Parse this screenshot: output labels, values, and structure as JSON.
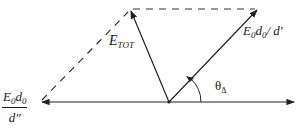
{
  "diagram": {
    "vectors": [
      {
        "id": "e-tot",
        "label_main": "E",
        "label_sub": "TOT",
        "style": "solid"
      },
      {
        "id": "e0d0-over-dprime",
        "label_main": "E",
        "label_sub1": "0",
        "label_mid": "d",
        "label_sub2": "0",
        "label_tail": "/ d′",
        "style": "solid"
      },
      {
        "id": "e0d0-over-ddprime",
        "numerator_main": "E",
        "numerator_sub1": "0",
        "numerator_mid": "d",
        "numerator_sub2": "0",
        "denominator": "d″",
        "style": "solid"
      }
    ],
    "construction_lines": {
      "style": "dashed",
      "count": 2
    },
    "angle": {
      "symbol": "θ",
      "subscript": "Δ"
    },
    "line_color": "#222222"
  }
}
